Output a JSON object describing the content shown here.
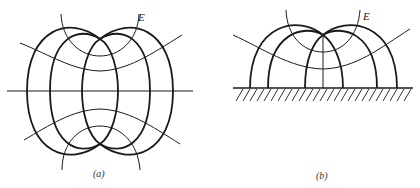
{
  "figures": [
    {
      "id": "a",
      "caption": "(a)",
      "field_label": "E",
      "description": "Field lines and equipotentials of a dipole-like pair (two point sources on vertical axis) with horizontal symmetry line"
    },
    {
      "id": "b",
      "caption": "(b)",
      "field_label": "E",
      "description": "Half-space field lines and equipotentials of a source above a grounded (hatched) plane"
    }
  ],
  "colors": {
    "line": "#1a1a1a",
    "background": "#ffffff"
  }
}
